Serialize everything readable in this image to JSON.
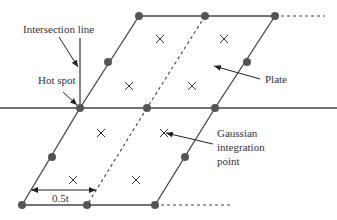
{
  "diagram": {
    "title": "",
    "labels": {
      "intersection_line": "Intersection line",
      "hot_spot": "Hot spot",
      "plate": "Plate",
      "gaussian_line1": "Gaussian",
      "gaussian_line2": "integration",
      "gaussian_line3": "point",
      "dimension": "0.5t"
    },
    "colors": {
      "line": "#444444",
      "node": "#555555",
      "background": "#ffffff"
    },
    "nodes": [
      {
        "x": 139,
        "y": 16
      },
      {
        "x": 205,
        "y": 16
      },
      {
        "x": 275,
        "y": 16
      },
      {
        "x": 108,
        "y": 62
      },
      {
        "x": 247,
        "y": 62
      },
      {
        "x": 80,
        "y": 108
      },
      {
        "x": 147,
        "y": 108
      },
      {
        "x": 215,
        "y": 108
      },
      {
        "x": 52,
        "y": 157
      },
      {
        "x": 185,
        "y": 157
      },
      {
        "x": 22,
        "y": 205
      },
      {
        "x": 87,
        "y": 205
      },
      {
        "x": 155,
        "y": 205
      }
    ],
    "gauss_points": [
      {
        "x": 160,
        "y": 39
      },
      {
        "x": 224,
        "y": 39
      },
      {
        "x": 129,
        "y": 86
      },
      {
        "x": 192,
        "y": 86
      },
      {
        "x": 101,
        "y": 133
      },
      {
        "x": 164,
        "y": 133
      },
      {
        "x": 73,
        "y": 180
      },
      {
        "x": 136,
        "y": 180
      }
    ]
  }
}
